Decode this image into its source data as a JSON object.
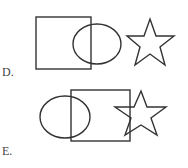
{
  "options": [
    {
      "label": "D.",
      "shapes": [
        "square",
        "circle",
        "star"
      ],
      "description": "Square overlapping circle on the left, separate star on the right"
    },
    {
      "label": "E.",
      "shapes": [
        "circle",
        "square",
        "star"
      ],
      "description": "Circle overlapping square, square overlapping star"
    }
  ]
}
